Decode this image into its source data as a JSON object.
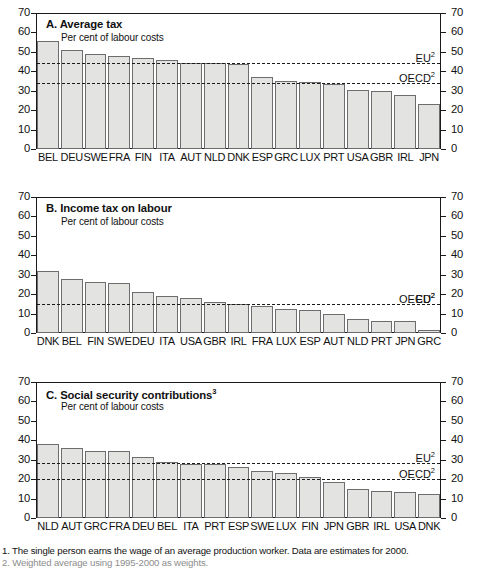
{
  "figure": {
    "footnotes": [
      "1. The single person earns the wage of an average production worker. Data are estimates for 2000.",
      "2. Weighted average using 1995-2000 as weights."
    ]
  },
  "chart_data": [
    {
      "type": "bar",
      "panel": "A",
      "title": "A.  Average tax",
      "subtitle": "Per cent of labour costs",
      "xlabel": "",
      "ylabel": "Per cent of labour costs",
      "ylim": [
        0,
        70
      ],
      "yticks": [
        0,
        10,
        20,
        30,
        40,
        50,
        60,
        70
      ],
      "grid": false,
      "categories": [
        "BEL",
        "DEU",
        "SWE",
        "FRA",
        "FIN",
        "ITA",
        "AUT",
        "NLD",
        "DNK",
        "ESP",
        "GRC",
        "LUX",
        "PRT",
        "USA",
        "GBR",
        "IRL",
        "JPN"
      ],
      "values": [
        55.6,
        51.0,
        48.9,
        47.9,
        46.6,
        45.7,
        44.4,
        44.3,
        44.0,
        37.0,
        35.1,
        34.7,
        33.3,
        30.3,
        29.7,
        28.0,
        23.3
      ],
      "reference_lines": [
        {
          "label": "EU",
          "superscript": "2",
          "value": 44.2
        },
        {
          "label": "OECD",
          "superscript": "2",
          "value": 33.8
        }
      ]
    },
    {
      "type": "bar",
      "panel": "B",
      "title": "B.  Income tax on labour",
      "subtitle": "Per cent of labour costs",
      "xlabel": "",
      "ylabel": "Per cent of labour costs",
      "ylim": [
        0,
        70
      ],
      "yticks": [
        0,
        10,
        20,
        30,
        40,
        50,
        60,
        70
      ],
      "grid": false,
      "categories": [
        "DNK",
        "BEL",
        "FIN",
        "SWE",
        "DEU",
        "ITA",
        "USA",
        "GBR",
        "IRL",
        "FRA",
        "LUX",
        "ESP",
        "AUT",
        "NLD",
        "PRT",
        "JPN",
        "GRC"
      ],
      "values": [
        32.1,
        27.7,
        26.4,
        25.9,
        20.9,
        19.0,
        17.8,
        15.8,
        14.8,
        14.0,
        12.4,
        11.8,
        9.6,
        7.1,
        6.3,
        6.1,
        1.7
      ],
      "reference_lines": [
        {
          "label": "EU",
          "superscript": "2",
          "value": 15.1
        },
        {
          "label": "OECD",
          "superscript": "2",
          "value": 14.7
        }
      ]
    },
    {
      "type": "bar",
      "panel": "C",
      "title": "C.  Social security contributions",
      "title_superscript": "3",
      "subtitle": "Per cent of labour costs",
      "xlabel": "",
      "ylabel": "Per cent of labour costs",
      "ylim": [
        0,
        70
      ],
      "yticks": [
        0,
        10,
        20,
        30,
        40,
        50,
        60,
        70
      ],
      "grid": false,
      "categories": [
        "NLD",
        "AUT",
        "GRC",
        "FRA",
        "DEU",
        "BEL",
        "ITA",
        "PRT",
        "ESP",
        "SWE",
        "LUX",
        "FIN",
        "JPN",
        "GBR",
        "IRL",
        "USA",
        "DNK"
      ],
      "values": [
        38.3,
        36.2,
        34.7,
        34.5,
        31.5,
        29.0,
        28.0,
        27.8,
        26.0,
        24.0,
        23.2,
        21.0,
        18.3,
        15.1,
        13.9,
        13.3,
        12.3
      ],
      "reference_lines": [
        {
          "label": "EU",
          "superscript": "2",
          "value": 28.3
        },
        {
          "label": "OECD",
          "superscript": "2",
          "value": 20.0
        }
      ]
    }
  ],
  "colors": {
    "bar_fill": "#e3e3e1",
    "bar_stroke": "#6d6d6d",
    "axis": "#1a1a1a",
    "text": "#111111"
  }
}
